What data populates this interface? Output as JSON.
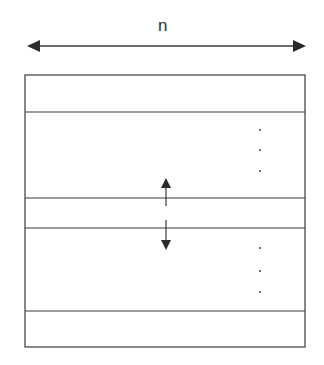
{
  "diagram": {
    "width_label": "n",
    "colors": {
      "line": "#3a3a3a",
      "background": "#ffffff"
    },
    "width_arrow": {
      "x1": 27,
      "x2": 306,
      "y": 46
    },
    "box": {
      "x": 25,
      "y": 75,
      "w": 280,
      "h": 272
    },
    "row_dividers_y": [
      112,
      198,
      228,
      311
    ],
    "up_arrow": {
      "x": 166,
      "y_top": 178,
      "y_bottom": 206
    },
    "down_arrow": {
      "x": 166,
      "y_top": 220,
      "y_bottom": 250
    },
    "ellipsis_upper": {
      "x": 260,
      "ys": [
        130,
        150,
        171
      ]
    },
    "ellipsis_lower": {
      "x": 260,
      "ys": [
        248,
        271,
        292
      ]
    }
  }
}
